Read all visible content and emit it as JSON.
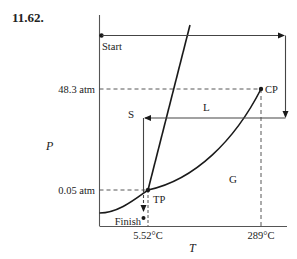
{
  "problem_number": "11.62.",
  "axes": {
    "x_label": "T",
    "y_label": "P"
  },
  "labels": {
    "start": "Start",
    "finish": "Finish",
    "solid": "S",
    "liquid": "L",
    "gas": "G",
    "triple_point": "TP",
    "critical_point": "CP"
  },
  "ticks": {
    "p_critical": "48.3 atm",
    "p_triple": "0.05 atm",
    "t_triple": "5.52°C",
    "t_critical": "289°C"
  },
  "colors": {
    "line": "#1a1a1a",
    "axis": "#555555",
    "dashed": "#444444",
    "text": "#222222"
  }
}
